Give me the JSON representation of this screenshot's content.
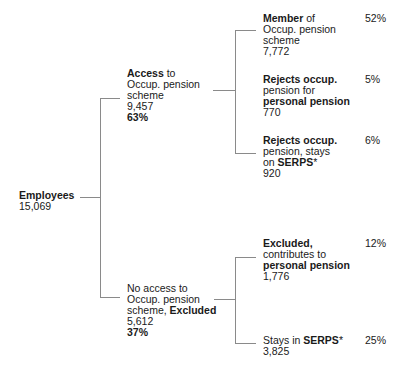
{
  "root": {
    "label": "Employees",
    "count": "15,069"
  },
  "access": {
    "label_bold": "Access",
    "label_rest1": " to",
    "label_line2": "Occup. pension",
    "label_line3": "scheme",
    "count": "9,457",
    "pct": "63%",
    "children": [
      {
        "bold": "Member",
        "rest": " of",
        "line2": "Occup. pension",
        "line3": "scheme",
        "count": "7,772",
        "pct": "52%"
      },
      {
        "bold": "Rejects occup.",
        "line2": "pension for",
        "line3_bold": "personal pension",
        "count": "770",
        "pct": "5%"
      },
      {
        "bold": "Rejects occup.",
        "line2": "pension, stays",
        "line3_pre": "on ",
        "line3_bold": "SERPS",
        "line3_post": "*",
        "count": "920",
        "pct": "6%"
      }
    ]
  },
  "no_access": {
    "line1": "No access to",
    "line2": "Occup. pension",
    "line3_pre": "scheme, ",
    "line3_bold": "Excluded",
    "count": "5,612",
    "pct": "37%",
    "children": [
      {
        "bold": "Excluded,",
        "line2": "contributes to",
        "line3_bold": "personal pension",
        "count": "1,776",
        "pct": "12%"
      },
      {
        "pre": "Stays in ",
        "bold": "SERPS",
        "post": "*",
        "count": "3,825",
        "pct": "25%"
      }
    ]
  },
  "colors": {
    "lines": "#8a8a8a",
    "text": "#1a1a1a"
  }
}
